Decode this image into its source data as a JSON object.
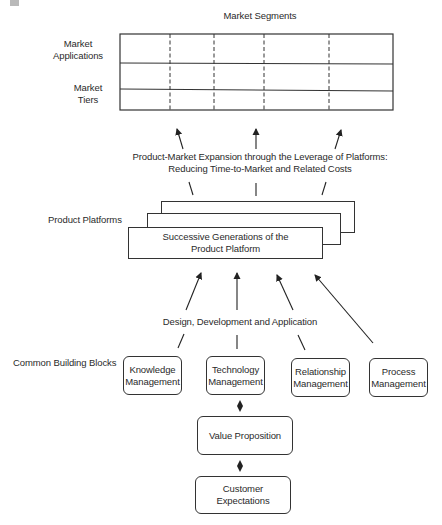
{
  "diagram": {
    "top_label": "Market Segments",
    "row_labels": {
      "applications": "Market Applications",
      "tiers": "Market Tiers"
    },
    "expansion_caption_line1": "Product-Market Expansion through the Leverage of Platforms:",
    "expansion_caption_line2": "Reducing Time-to-Market and Related Costs",
    "platforms_label": "Product Platforms",
    "platform_box_line1": "Successive Generations of the",
    "platform_box_line2": "Product Platform",
    "ddа_caption": "Design, Development and Application",
    "building_blocks_label": "Common Building Blocks",
    "building_blocks": [
      {
        "line1": "Knowledge",
        "line2": "Management"
      },
      {
        "line1": "Technology",
        "line2": "Management"
      },
      {
        "line1": "Relationship",
        "line2": "Management"
      },
      {
        "line1": "Process",
        "line2": "Management"
      }
    ],
    "value_proposition": "Value Proposition",
    "customer_expectations_line1": "Customer",
    "customer_expectations_line2": "Expectations",
    "grid": {
      "segment_columns": 5,
      "rows": 3
    },
    "colors": {
      "line": "#333333",
      "text": "#2a2a2a",
      "background": "#ffffff"
    }
  },
  "design_caption": "Design, Development and Application"
}
